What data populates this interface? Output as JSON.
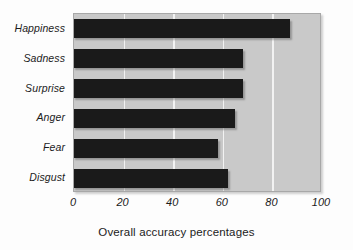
{
  "chart_data": {
    "type": "bar",
    "orientation": "horizontal",
    "title": "",
    "xlabel": "Overall accuracy percentages",
    "ylabel": "",
    "categories": [
      "Happiness",
      "Sadness",
      "Surprise",
      "Anger",
      "Fear",
      "Disgust"
    ],
    "values": [
      87,
      68,
      68,
      65,
      58,
      62
    ],
    "xlim": [
      0,
      100
    ],
    "xticks": [
      0,
      20,
      40,
      60,
      80,
      100
    ],
    "xtick_labels": [
      "0",
      "20",
      "40",
      "60",
      "80",
      "100"
    ],
    "gridlines": [
      20,
      40,
      60,
      80
    ],
    "grid": true,
    "legend": null,
    "colors": {
      "bar": "#1a1a1a",
      "plot_background": "#c9c9c9",
      "gridline": "#f2f2f2",
      "page_background": "#ffffff",
      "text": "#1b1b1b",
      "frame": "#a8a8a8"
    },
    "series": [
      {
        "name": "Overall accuracy percentages",
        "points": [
          {
            "category": "Happiness",
            "value": 87
          },
          {
            "category": "Sadness",
            "value": 68
          },
          {
            "category": "Surprise",
            "value": 68
          },
          {
            "category": "Anger",
            "value": 65
          },
          {
            "category": "Fear",
            "value": 58
          },
          {
            "category": "Disgust",
            "value": 62
          }
        ]
      }
    ]
  }
}
